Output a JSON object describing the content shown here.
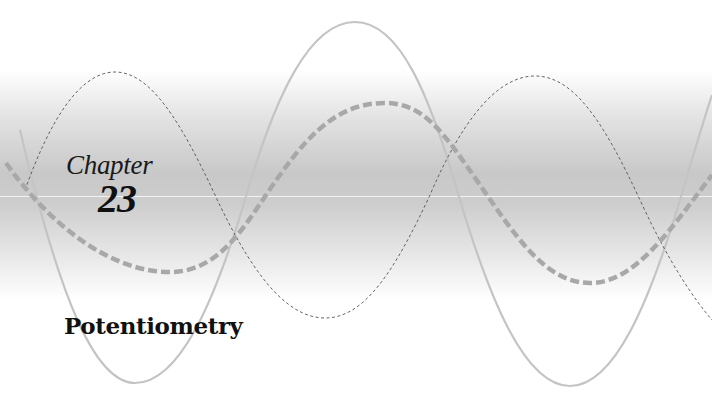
{
  "chapter": {
    "label": "Chapter",
    "number": "23",
    "title": "Potentiometry"
  },
  "decoration": {
    "icons": [
      "solid-sine-wave",
      "fine-dashed-sine-wave",
      "bold-dashed-sine-wave"
    ],
    "colors": {
      "background": "#ffffff",
      "band": "#c8c8c8",
      "solid_wave": "#c4c4c4",
      "fine_dashed_wave": "#555555",
      "bold_dashed_wave": "#a8a8a8",
      "text": "#111111"
    }
  }
}
